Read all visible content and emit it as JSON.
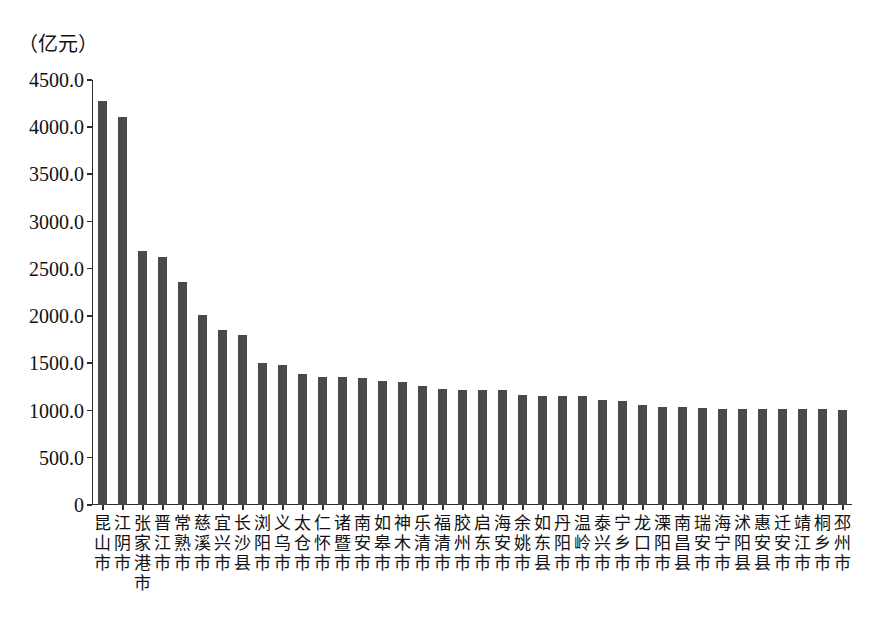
{
  "chart_data": {
    "type": "bar",
    "title": "",
    "subtitle": "",
    "unit_label": "（亿元）",
    "xlabel": "",
    "ylabel": "",
    "ylim": [
      0,
      4500
    ],
    "grid": false,
    "legend": null,
    "ytick_labels": [
      "4500.0",
      "4000.0",
      "3500.0",
      "3000.0",
      "2500.0",
      "2000.0",
      "1500.0",
      "1000.0",
      "500.0",
      "0"
    ],
    "ytick_values": [
      4500,
      4000,
      3500,
      3000,
      2500,
      2000,
      1500,
      1000,
      500,
      0
    ],
    "categories": [
      "昆山市",
      "江阴市",
      "张家港市",
      "晋江市",
      "常熟市",
      "慈溪市",
      "宜兴市",
      "长沙县",
      "浏阳市",
      "义乌市",
      "太仓市",
      "仁怀市",
      "诸暨市",
      "南安市",
      "如皋市",
      "神木市",
      "乐清市",
      "福清市",
      "胶州市",
      "启东市",
      "海安市",
      "余姚市",
      "如东县",
      "丹阳市",
      "温岭市",
      "泰兴市",
      "宁乡市",
      "龙口市",
      "溧阳市",
      "南昌县",
      "瑞安市",
      "海宁市",
      "沭阳县",
      "惠安县",
      "迁安市",
      "靖江市",
      "桐乡市",
      "邳州市"
    ],
    "values": [
      4280,
      4110,
      2690,
      2630,
      2360,
      2010,
      1850,
      1800,
      1500,
      1480,
      1390,
      1360,
      1355,
      1350,
      1310,
      1300,
      1265,
      1225,
      1215,
      1215,
      1215,
      1160,
      1150,
      1150,
      1150,
      1110,
      1100,
      1060,
      1040,
      1040,
      1030,
      1020,
      1020,
      1015,
      1015,
      1015,
      1015,
      1010
    ],
    "colors": {
      "bar": "#4a4a4a",
      "axis": "#2b2b2b",
      "text": "#111111",
      "background": "#ffffff"
    }
  }
}
